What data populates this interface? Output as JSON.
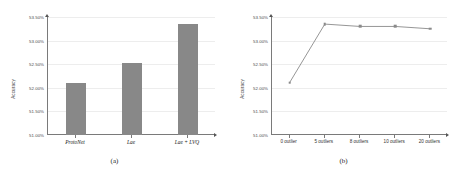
{
  "figure": {
    "subfigures": [
      {
        "caption": "(a)",
        "chart_data": {
          "type": "bar",
          "title": "",
          "xlabel": "",
          "ylabel": "Accuracy",
          "categories": [
            "ProtoNet",
            "Lae",
            "Lae + LVQ"
          ],
          "values": [
            52.1,
            52.52,
            53.35
          ],
          "ylim": [
            51.0,
            53.5
          ],
          "ytick_labels": [
            "51.00%",
            "51.50%",
            "52.00%",
            "52.50%",
            "53.00%",
            "53.50%"
          ],
          "ytick_values": [
            51.0,
            51.5,
            52.0,
            52.5,
            53.0,
            53.5
          ],
          "grid": true,
          "legend": "none",
          "series_color": "#888888",
          "value_suffix": "%"
        }
      },
      {
        "caption": "(b)",
        "chart_data": {
          "type": "line",
          "title": "",
          "xlabel": "",
          "ylabel": "Accuracy",
          "categories": [
            "0 outlier",
            "5 outliers",
            "8 outliers",
            "10 outliers",
            "20 outliers"
          ],
          "values": [
            52.11,
            53.35,
            53.3,
            53.3,
            53.25
          ],
          "ylim": [
            51.0,
            53.5
          ],
          "ytick_labels": [
            "51.00%",
            "51.50%",
            "52.00%",
            "52.50%",
            "53.00%",
            "53.50%"
          ],
          "ytick_values": [
            51.0,
            51.5,
            52.0,
            52.5,
            53.0,
            53.5
          ],
          "grid": true,
          "legend": "none",
          "series_color": "#8a8a8a",
          "marker": "cross",
          "value_suffix": "%"
        }
      }
    ]
  },
  "colors": {
    "bar_fill": "#888888",
    "line_stroke": "#8a8a8a",
    "axis": "#7a7a7a",
    "grid": "#ededed",
    "text": "#333333",
    "background": "#ffffff"
  }
}
